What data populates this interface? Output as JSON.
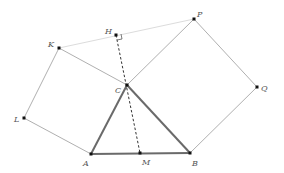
{
  "diagram": {
    "points": {
      "A": {
        "label": "A",
        "x": 91,
        "y": 154
      },
      "B": {
        "label": "B",
        "x": 190,
        "y": 153
      },
      "C": {
        "label": "C",
        "x": 127,
        "y": 85
      },
      "M": {
        "label": "M",
        "x": 140,
        "y": 153
      },
      "H": {
        "label": "H",
        "x": 116,
        "y": 35
      },
      "K": {
        "label": "K",
        "x": 59,
        "y": 48
      },
      "L": {
        "label": "L",
        "x": 24,
        "y": 118
      },
      "P": {
        "label": "P",
        "x": 194,
        "y": 19
      },
      "Q": {
        "label": "Q",
        "x": 257,
        "y": 87
      }
    },
    "colors": {
      "triangle": "#6a6a6a",
      "square": "#9a9a9a",
      "faint": "#d8d8d8",
      "dashed": "#333333",
      "point": "#111111",
      "label": "#555555"
    }
  }
}
